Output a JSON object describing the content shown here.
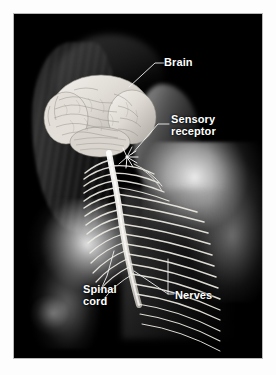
{
  "figure": {
    "kind": "anatomical-photo-illustration",
    "background_color": "#000000",
    "page_background": "#ffffff",
    "label_color": "#ffffff",
    "leader_line_color": "#f0f0f0",
    "border_color": "#b9b9b9"
  },
  "labels": [
    {
      "id": "brain",
      "text": "Brain",
      "x": 150,
      "y": 43
    },
    {
      "id": "sensory",
      "text": "Sensory\nreceptor",
      "x": 157,
      "y": 100
    },
    {
      "id": "spinal",
      "text": "Spinal\ncord",
      "x": 69,
      "y": 270
    },
    {
      "id": "nerves",
      "text": "Nerves",
      "x": 161,
      "y": 276
    }
  ],
  "anatomy": {
    "brain_label": "Brain",
    "sensory_receptor_label": "Sensory receptor",
    "spinal_cord_label": "Spinal cord",
    "nerves_label": "Nerves"
  }
}
